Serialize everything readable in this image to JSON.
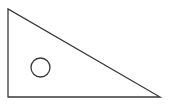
{
  "figure": {
    "title": "Right triangle with inscribed circle",
    "type": "line-drawing",
    "canvas": {
      "width": 172,
      "height": 108,
      "background_color": "#ffffff"
    },
    "style": {
      "stroke_color": "#3a3a3a",
      "stroke_width": 1.3,
      "fill": "none"
    },
    "shapes": [
      {
        "name": "triangle",
        "kind": "polygon",
        "label": "right triangle",
        "points": "8,9 8,97 160,97",
        "vertices": [
          {
            "name": "apex-top-left",
            "x": 8,
            "y": 9
          },
          {
            "name": "right-angle-bottom-left",
            "x": 8,
            "y": 97
          },
          {
            "name": "bottom-right",
            "x": 160,
            "y": 97
          }
        ],
        "right_angle_at": "bottom-left",
        "leg_vertical_length": 88,
        "leg_horizontal_length": 152
      },
      {
        "name": "circle",
        "kind": "circle",
        "label": "circle inside triangle",
        "cx": 40.5,
        "cy": 67.5,
        "r": 9.5
      }
    ]
  }
}
